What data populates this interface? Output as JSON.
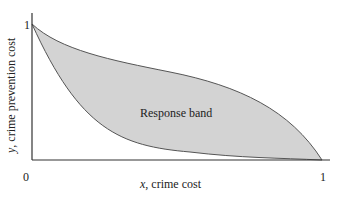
{
  "diagram": {
    "region_label": "Response band",
    "x_axis": {
      "var": "x",
      "label": ", crime cost",
      "tick_min": "0",
      "tick_max": "1"
    },
    "y_axis": {
      "var": "y",
      "label": ", crime prevention cost",
      "tick_max": "1"
    },
    "colors": {
      "band_fill": "#d3d3d3",
      "curve": "#555555",
      "axis": "#333333"
    }
  }
}
